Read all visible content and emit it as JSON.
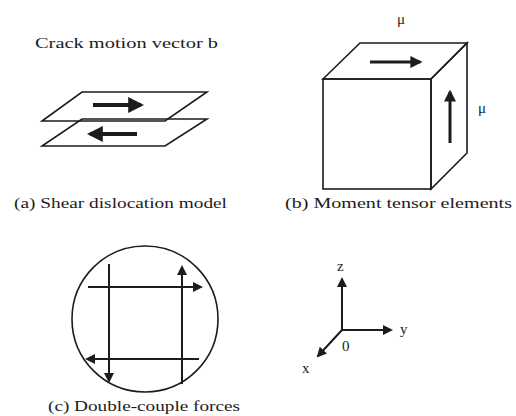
{
  "figure": {
    "panel_a": {
      "title": "Crack motion vector b",
      "caption": "(a) Shear dislocation model"
    },
    "panel_b": {
      "top_label": "μ",
      "side_label": "μ",
      "caption": "(b) Moment tensor elements",
      "side_face_fill": "#e2e2e2"
    },
    "panel_c": {
      "caption": "(c) Double-couple forces"
    },
    "panel_d": {
      "axis_z": "z",
      "axis_y": "y",
      "axis_x": "x",
      "origin": "0"
    }
  },
  "colors": {
    "ink": "#1c1c1c",
    "background": "#ffffff"
  }
}
